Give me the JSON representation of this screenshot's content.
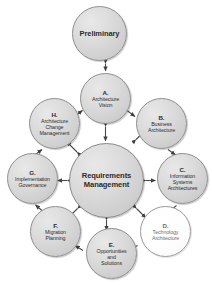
{
  "diagram": {
    "type": "cycle-diagram",
    "background_color": "#ffffff",
    "node_fill_color": "#d8d8d8",
    "node_border_color": "#8e8e8e",
    "highlight_fill_color": "#ffffff",
    "text_color": "#2c2c2c",
    "arrow_color": "#4a4a4a"
  },
  "preliminary": {
    "label": "Preliminary"
  },
  "hub": {
    "label": "Requirements\nManagement"
  },
  "phases": [
    {
      "id": "a",
      "letter": "A.",
      "name": "Architecture\nVision",
      "highlight": false
    },
    {
      "id": "b",
      "letter": "B.",
      "name": "Business\nArchitecture",
      "highlight": false
    },
    {
      "id": "c",
      "letter": "C.",
      "name": "Information\nSystems\nArchitectures",
      "highlight": false
    },
    {
      "id": "d",
      "letter": "D.",
      "name": "Technology\nArchitecture",
      "highlight": true
    },
    {
      "id": "e",
      "letter": "E.",
      "name": "Opportunities\nand\nSolutions",
      "highlight": false
    },
    {
      "id": "f",
      "letter": "F.",
      "name": "Migration\nPlanning",
      "highlight": false
    },
    {
      "id": "g",
      "letter": "G.",
      "name": "Implementation\nGovernance",
      "highlight": false
    },
    {
      "id": "h",
      "letter": "H.",
      "name": "Architecture\nChange\nManagement",
      "highlight": false
    }
  ],
  "connections": {
    "preliminary_to_vision": "bidirectional",
    "hub_spokes": "bidirectional",
    "ring_direction": "clockwise"
  }
}
